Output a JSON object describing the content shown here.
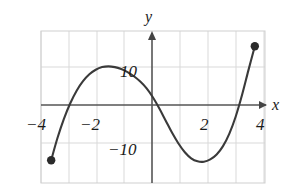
{
  "figure": {
    "background_color": "#ffffff",
    "plot_area": {
      "x": 41,
      "y": 31,
      "width": 224,
      "height": 152
    },
    "colors": {
      "grid": "#d9d9d9",
      "border": "#cfcfcf",
      "axis": "#4a4a4a",
      "curve": "#3a3a3a",
      "text": "#1a1a1a",
      "endpoint": "#2b2b2b"
    }
  },
  "axes": {
    "x_axis_label": "x",
    "y_axis_label": "y",
    "x_ticks": [
      {
        "label": "−4",
        "value": -4
      },
      {
        "label": "−2",
        "value": -2
      },
      {
        "label": "2",
        "value": 2
      },
      {
        "label": "4",
        "value": 4
      }
    ],
    "y_ticks": [
      {
        "label": "10",
        "value": 10
      },
      {
        "label": "−10",
        "value": -10
      }
    ],
    "xlim": [
      -4.4,
      4.4
    ],
    "ylim": [
      -20,
      20
    ],
    "grid": true,
    "grid_step_x": 1,
    "grid_step_y": 10,
    "arrows": {
      "x_positive": true,
      "y_positive": true
    }
  },
  "chart_data": {
    "type": "line",
    "title": "",
    "xlabel": "x",
    "ylabel": "y",
    "xlim": [
      -4.4,
      4.4
    ],
    "ylim": [
      -20,
      20
    ],
    "grid": true,
    "legend": "none",
    "series": [
      {
        "name": "cubic curve",
        "x": [
          -4.0,
          -3.75,
          -3.5,
          -3.25,
          -3.0,
          -2.75,
          -2.5,
          -2.25,
          -2.0,
          -1.75,
          -1.5,
          -1.25,
          -1.0,
          -0.75,
          -0.5,
          -0.25,
          0.0,
          0.25,
          0.5,
          0.75,
          1.0,
          1.25,
          1.5,
          1.75,
          2.0,
          2.25,
          2.5,
          2.75,
          3.0,
          3.25,
          3.5,
          3.75,
          4.0
        ],
        "y": [
          -14.0,
          -8.1,
          -3.1,
          1.0,
          4.3,
          6.8,
          8.6,
          9.8,
          10.5,
          10.7,
          10.5,
          10.0,
          9.2,
          8.1,
          6.7,
          4.9,
          2.5,
          -0.4,
          -3.6,
          -6.8,
          -9.6,
          -11.9,
          -13.5,
          -14.3,
          -14.4,
          -13.8,
          -12.5,
          -10.3,
          -7.0,
          -2.5,
          3.2,
          9.7,
          16.0
        ]
      }
    ],
    "annotations": [
      {
        "kind": "closed-endpoint",
        "x": -4,
        "y": -14
      },
      {
        "kind": "closed-endpoint",
        "x": 4,
        "y": 16
      }
    ],
    "endpoints": {
      "left": {
        "x": -4,
        "y": -14,
        "style": "filled-circle"
      },
      "right": {
        "x": 4,
        "y": 16,
        "style": "filled-circle"
      }
    }
  }
}
